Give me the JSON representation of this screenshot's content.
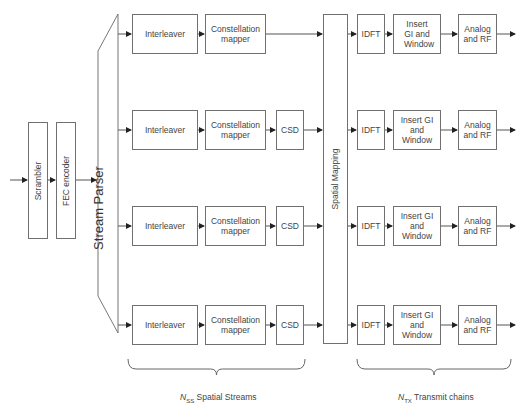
{
  "diagram": {
    "input_blocks": [
      {
        "label": "Scrambler"
      },
      {
        "label": "FEC encoder"
      }
    ],
    "stream_parser": {
      "label": "Stream Parser"
    },
    "spatial_mapping": {
      "label": "Spatial Mapping"
    },
    "streams": [
      {
        "interleaver": "Interleaver",
        "mapper": "Constellation mapper",
        "csd": null
      },
      {
        "interleaver": "Interleaver",
        "mapper": "Constellation mapper",
        "csd": "CSD"
      },
      {
        "interleaver": "Interleaver",
        "mapper": "Constellation mapper",
        "csd": "CSD"
      },
      {
        "interleaver": "Interleaver",
        "mapper": "Constellation mapper",
        "csd": "CSD"
      }
    ],
    "tx_chains": [
      {
        "idft": "IDFT",
        "gi": "Insert GI and Window",
        "rf": "Analog and RF"
      },
      {
        "idft": "IDFT",
        "gi": "Insert GI and Window",
        "rf": "Analog and RF"
      },
      {
        "idft": "IDFT",
        "gi": "Insert GI and Window",
        "rf": "Analog and RF"
      },
      {
        "idft": "IDFT",
        "gi": "Insert GI and Window",
        "rf": "Analog and RF"
      }
    ],
    "braces": {
      "spatial_streams": {
        "var": "N",
        "sub": "SS",
        "text": " Spatial Streams"
      },
      "transmit_chains": {
        "var": "N",
        "sub": "TX",
        "text": " Transmit chains"
      }
    }
  }
}
